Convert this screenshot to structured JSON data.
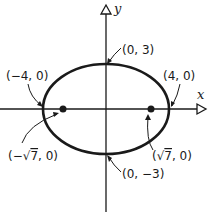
{
  "diagram": {
    "type": "ellipse",
    "equation_center": [
      0,
      0
    ],
    "semi_major_a": 4,
    "semi_minor_b": 3,
    "focal_c": "√7",
    "axes": {
      "x_label": "x",
      "y_label": "y"
    },
    "labels": {
      "top_vertex": "(0, 3)",
      "bottom_vertex": "(0, −3)",
      "left_vertex": "(−4, 0)",
      "right_vertex": "(4, 0)",
      "left_focus_pre": "(−",
      "left_focus_rad": "7",
      "left_focus_post": ", 0)",
      "right_focus_pre": "(",
      "right_focus_rad": "7",
      "right_focus_post": ", 0)"
    },
    "colors": {
      "ink": "#1a1a1a",
      "background": "#ffffff"
    }
  }
}
